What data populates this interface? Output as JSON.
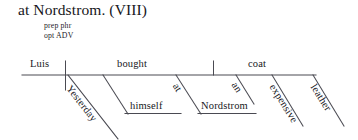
{
  "header": {
    "title": "at Nordstrom. (VIII)",
    "gloss_line_1": "prep phr",
    "gloss_line_2": "opt ADV"
  },
  "diagram": {
    "type": "reed-kellogg-sentence-diagram",
    "ink_color": "#4a4a52",
    "baseline": {
      "x1": 22,
      "y1": 75,
      "x2": 316,
      "y2": 75
    },
    "nodes": {
      "subject": "Luis",
      "verb": "bought",
      "direct_object": "coat",
      "adverb": "Yesterday",
      "indirect_object": "himself",
      "preposition": "at",
      "prep_object": "Nordstrom",
      "article": "an",
      "adjective_1": "expensive",
      "adjective_2": "leather"
    },
    "dividers": {
      "subject_verb": "full",
      "verb_object": "stub"
    }
  }
}
